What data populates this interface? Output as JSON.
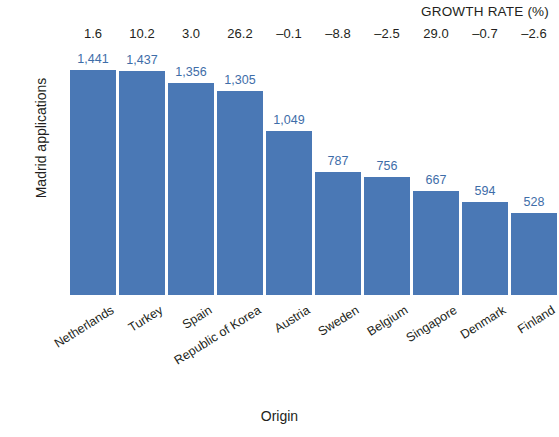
{
  "chart_data": {
    "type": "bar",
    "title": "",
    "xlabel": "Origin",
    "ylabel": "Madrid applications",
    "categories": [
      "Netherlands",
      "Turkey",
      "Spain",
      "Republic of Korea",
      "Austria",
      "Sweden",
      "Belgium",
      "Singapore",
      "Denmark",
      "Finland"
    ],
    "values": [
      1441,
      1437,
      1356,
      1305,
      1049,
      787,
      756,
      667,
      594,
      528
    ],
    "value_labels": [
      "1,441",
      "1,437",
      "1,356",
      "1,305",
      "1,049",
      "787",
      "756",
      "667",
      "594",
      "528"
    ],
    "ylim": [
      0,
      1890
    ],
    "grid": false,
    "legend": null,
    "series": [
      {
        "name": "Madrid applications",
        "values": [
          1441,
          1437,
          1356,
          1305,
          1049,
          787,
          756,
          667,
          594,
          528
        ]
      }
    ],
    "annotations": {
      "growth_rate_header": "GROWTH RATE (%)",
      "growth_rate_values": [
        "1.6",
        "10.2",
        "3.0",
        "26.2",
        "–0.1",
        "–8.8",
        "–2.5",
        "29.0",
        "–0.7",
        "–2.6"
      ]
    },
    "colors": {
      "bar": "#4a78b5",
      "value_label": "#3e6da8",
      "text": "#231f20",
      "background": "#ffffff"
    }
  }
}
